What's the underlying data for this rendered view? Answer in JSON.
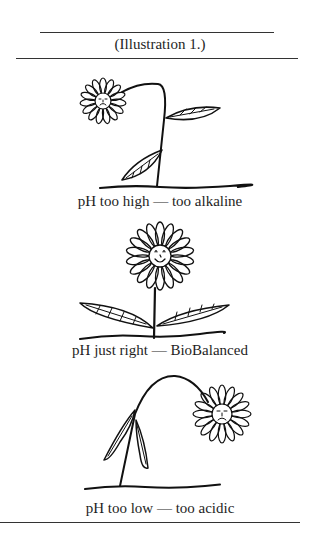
{
  "header": {
    "label": "(Illustration 1.)"
  },
  "panels": [
    {
      "id": "alkaline",
      "caption": "pH too high — too alkaline",
      "mood": "sad",
      "pose": "drooping-left"
    },
    {
      "id": "balanced",
      "caption": "pH just right — BioBalanced",
      "mood": "happy",
      "pose": "upright"
    },
    {
      "id": "acidic",
      "caption": "pH too low — too acidic",
      "mood": "sad",
      "pose": "drooping-right"
    }
  ]
}
